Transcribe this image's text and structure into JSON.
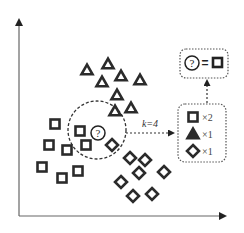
{
  "diagram": {
    "colors": {
      "ink": "#2b2b2b",
      "axis": "#555555",
      "dash": "#333333"
    },
    "axes": {
      "origin": [
        19,
        216
      ],
      "y_top": 17,
      "x_right": 228
    },
    "classes": {
      "square": [
        [
          55,
          124
        ],
        [
          80,
          131
        ],
        [
          49,
          145
        ],
        [
          67,
          150
        ],
        [
          86,
          145
        ],
        [
          42,
          167
        ],
        [
          62,
          178
        ],
        [
          78,
          171
        ]
      ],
      "triangle": [
        [
          87,
          70
        ],
        [
          108,
          64
        ],
        [
          102,
          82
        ],
        [
          121,
          76
        ],
        [
          140,
          80
        ],
        [
          117,
          95
        ],
        [
          131,
          108
        ],
        [
          115,
          111
        ]
      ],
      "diamond": [
        [
          112,
          145
        ],
        [
          130,
          158
        ],
        [
          145,
          160
        ],
        [
          139,
          173
        ],
        [
          164,
          172
        ],
        [
          121,
          182
        ],
        [
          133,
          196
        ],
        [
          152,
          194
        ]
      ]
    },
    "query": {
      "label": "?",
      "x": 98,
      "y": 133
    },
    "neighborhood": {
      "cx": 97,
      "cy": 130,
      "r": 29
    },
    "k_label": "k=4",
    "result": {
      "query_symbol": "?",
      "equals": "=",
      "predicted_class": "square"
    },
    "votes": [
      {
        "class": "square",
        "count": "×2"
      },
      {
        "class": "triangle",
        "count": "×1"
      },
      {
        "class": "diamond",
        "count": "×1"
      }
    ]
  }
}
